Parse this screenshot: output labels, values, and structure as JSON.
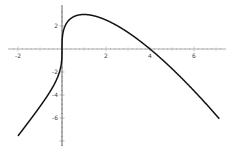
{
  "chart_data": {
    "type": "line",
    "title": "",
    "xlabel": "",
    "ylabel": "",
    "function": "x^(1/3) * (4 - x)",
    "xlim": [
      -2.1,
      7.3
    ],
    "ylim": [
      -8.3,
      3.3
    ],
    "grid": false,
    "legend": null,
    "x_ticks": [
      -2,
      2,
      4,
      6
    ],
    "y_ticks": [
      2,
      -2,
      -4,
      -6
    ],
    "x_tick_labels": [
      "-2",
      "2",
      "4",
      "6"
    ],
    "y_tick_labels": [
      "2",
      "-2",
      "-4",
      "-6"
    ],
    "series": [
      {
        "name": "f(x)",
        "x": [
          -2,
          -1.5,
          -1,
          -0.5,
          -0.1,
          0,
          0.1,
          0.5,
          1,
          1.5,
          2,
          3,
          4,
          5,
          6,
          7
        ],
        "values": [
          -7.56,
          -6.29,
          -5.0,
          -3.57,
          -1.9,
          0,
          1.8,
          2.78,
          3.0,
          2.86,
          2.52,
          1.44,
          0,
          -1.71,
          -3.63,
          -5.74
        ]
      }
    ],
    "annotations": {
      "peak": {
        "x": 1,
        "y": 3
      },
      "root": {
        "x": 4,
        "y": 0
      }
    }
  }
}
